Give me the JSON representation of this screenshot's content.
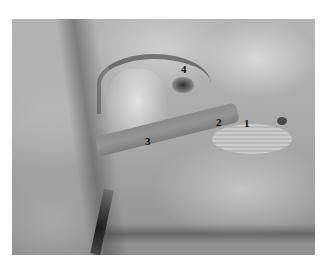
{
  "figure": {
    "type": "anatomical-photograph",
    "grayscale": true,
    "labels": [
      {
        "text": "1",
        "x": 244,
        "y": 118
      },
      {
        "text": "2",
        "x": 216,
        "y": 117
      },
      {
        "text": "3",
        "x": 145,
        "y": 136
      },
      {
        "text": "4",
        "x": 181,
        "y": 64
      }
    ]
  },
  "colors": {
    "background": "#ffffff",
    "label": "#111111"
  }
}
